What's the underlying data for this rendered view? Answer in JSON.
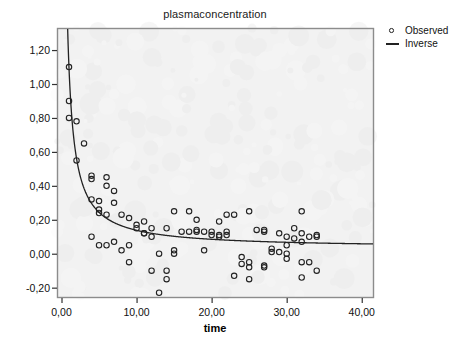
{
  "chart_data": {
    "type": "scatter",
    "title": "plasmaconcentration",
    "xlabel": "time",
    "ylabel": "",
    "xlim": [
      -0.6,
      41.5
    ],
    "ylim": [
      -0.255,
      1.33
    ],
    "grid": false,
    "legend_position": "right-top",
    "x_ticks": [
      0,
      10,
      20,
      30,
      40
    ],
    "x_tick_labels": [
      "0,00",
      "10,00",
      "20,00",
      "30,00",
      "40,00"
    ],
    "y_ticks": [
      -0.2,
      0.0,
      0.2,
      0.4,
      0.6,
      0.8,
      1.0,
      1.2
    ],
    "y_tick_labels": [
      "-0,20",
      "0,00",
      "0,20",
      "0,40",
      "0,60",
      "0,80",
      "1,00",
      "1,20"
    ],
    "series": [
      {
        "name": "Observed",
        "type": "scatter",
        "marker": "open-circle",
        "color": "#222222",
        "points": [
          [
            1.0,
            1.1
          ],
          [
            1.0,
            0.9
          ],
          [
            1.0,
            0.8
          ],
          [
            2.0,
            0.78
          ],
          [
            3.0,
            0.65
          ],
          [
            2.0,
            0.55
          ],
          [
            4.0,
            0.46
          ],
          [
            4.0,
            0.44
          ],
          [
            6.0,
            0.45
          ],
          [
            6.0,
            0.4
          ],
          [
            7.0,
            0.37
          ],
          [
            4.0,
            0.32
          ],
          [
            5.0,
            0.31
          ],
          [
            7.0,
            0.3
          ],
          [
            5.0,
            0.26
          ],
          [
            5.0,
            0.24
          ],
          [
            6.0,
            0.23
          ],
          [
            8.0,
            0.23
          ],
          [
            9.0,
            0.21
          ],
          [
            11.0,
            0.19
          ],
          [
            10.0,
            0.17
          ],
          [
            15.0,
            0.25
          ],
          [
            17.0,
            0.25
          ],
          [
            18.0,
            0.2
          ],
          [
            21.0,
            0.19
          ],
          [
            22.0,
            0.23
          ],
          [
            23.0,
            0.23
          ],
          [
            25.0,
            0.25
          ],
          [
            32.0,
            0.25
          ],
          [
            10.0,
            0.15
          ],
          [
            12.0,
            0.15
          ],
          [
            14.0,
            0.15
          ],
          [
            31.0,
            0.15
          ],
          [
            11.0,
            0.12
          ],
          [
            11.0,
            0.12
          ],
          [
            12.0,
            0.1
          ],
          [
            16.0,
            0.13
          ],
          [
            17.0,
            0.13
          ],
          [
            18.0,
            0.14
          ],
          [
            18.0,
            0.13
          ],
          [
            19.0,
            0.13
          ],
          [
            20.0,
            0.13
          ],
          [
            20.0,
            0.11
          ],
          [
            21.0,
            0.11
          ],
          [
            21.0,
            0.1
          ],
          [
            22.0,
            0.13
          ],
          [
            22.0,
            0.11
          ],
          [
            26.0,
            0.14
          ],
          [
            27.0,
            0.14
          ],
          [
            27.0,
            0.13
          ],
          [
            29.0,
            0.12
          ],
          [
            30.0,
            0.1
          ],
          [
            32.0,
            0.12
          ],
          [
            33.0,
            0.1
          ],
          [
            34.0,
            0.11
          ],
          [
            34.0,
            0.1
          ],
          [
            31.0,
            0.09
          ],
          [
            32.0,
            0.07
          ],
          [
            30.0,
            0.05
          ],
          [
            4.0,
            0.1
          ],
          [
            6.0,
            0.05
          ],
          [
            7.0,
            0.07
          ],
          [
            5.0,
            0.05
          ],
          [
            8.0,
            0.02
          ],
          [
            9.0,
            0.05
          ],
          [
            13.0,
            0.0
          ],
          [
            15.0,
            0.02
          ],
          [
            15.0,
            0.0
          ],
          [
            19.0,
            0.02
          ],
          [
            28.0,
            0.03
          ],
          [
            28.0,
            0.01
          ],
          [
            29.0,
            0.01
          ],
          [
            30.0,
            0.0
          ],
          [
            9.0,
            -0.05
          ],
          [
            12.0,
            -0.1
          ],
          [
            14.0,
            -0.1
          ],
          [
            14.0,
            -0.15
          ],
          [
            24.0,
            -0.02
          ],
          [
            24.0,
            -0.06
          ],
          [
            25.0,
            -0.05
          ],
          [
            25.0,
            -0.08
          ],
          [
            27.0,
            -0.07
          ],
          [
            27.0,
            -0.08
          ],
          [
            30.0,
            -0.03
          ],
          [
            32.0,
            -0.05
          ],
          [
            33.0,
            -0.05
          ],
          [
            34.0,
            -0.1
          ],
          [
            23.0,
            -0.13
          ],
          [
            25.0,
            -0.15
          ],
          [
            32.0,
            -0.14
          ],
          [
            13.0,
            -0.23
          ]
        ]
      },
      {
        "name": "Inverse",
        "type": "line",
        "color": "#222222",
        "equation": "y = b0 + b1/x",
        "b0": 0.032,
        "b1": 1.06,
        "x_range": [
          0.82,
          41.5
        ]
      }
    ]
  },
  "legend": {
    "items": [
      {
        "label": "Observed",
        "symbol": "open-circle-marker"
      },
      {
        "label": "Inverse",
        "symbol": "line-segment"
      }
    ]
  }
}
